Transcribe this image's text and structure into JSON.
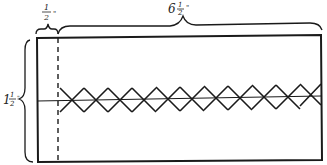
{
  "diagram": {
    "type": "sewing pattern diagram",
    "dimensions": {
      "seam_allowance": {
        "whole": "",
        "num": "1",
        "den": "2",
        "unit": "\""
      },
      "length": {
        "whole": "6",
        "num": "1",
        "den": "2",
        "unit": "\""
      },
      "height": {
        "whole": "1",
        "num": "1",
        "den": "2",
        "unit": "\""
      }
    },
    "elements": {
      "rectangle": "outer rectangle strip",
      "dashed_line": "fold / seam line",
      "center_line": "horizontal center line",
      "stitch_pattern": "cross-stitch X row",
      "stitch_count": 11
    },
    "colors": {
      "ink": "#1a1a1a",
      "background": "#ffffff"
    }
  }
}
